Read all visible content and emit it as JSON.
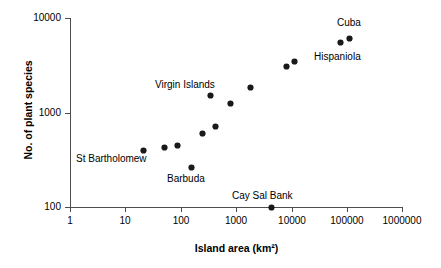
{
  "chart_data": {
    "type": "scatter",
    "title": "",
    "xlabel": "Island area (km²)",
    "ylabel": "No. of plant species",
    "xscale": "log",
    "yscale": "log",
    "xlim": [
      1,
      1000000
    ],
    "ylim": [
      100,
      10000
    ],
    "grid": false,
    "legend": "none",
    "xticks": [
      "1",
      "10",
      "100",
      "1000",
      "10000",
      "100000",
      "1000000"
    ],
    "yticks": [
      "100",
      "1000",
      "10000"
    ],
    "marker_color": "#1a1a1a",
    "axis_color": "#4d4d4d",
    "points": [
      {
        "label": "St Bartholomew",
        "x": 21,
        "y": 400
      },
      {
        "label": "",
        "x": 50,
        "y": 430
      },
      {
        "label": "",
        "x": 88,
        "y": 450
      },
      {
        "label": "Barbuda",
        "x": 155,
        "y": 265
      },
      {
        "label": "",
        "x": 250,
        "y": 600
      },
      {
        "label": "Virgin Islands",
        "x": 350,
        "y": 1500
      },
      {
        "label": "",
        "x": 430,
        "y": 720
      },
      {
        "label": "",
        "x": 780,
        "y": 1250
      },
      {
        "label": "",
        "x": 1800,
        "y": 1850
      },
      {
        "label": "Cay Sal Bank",
        "x": 4300,
        "y": 100
      },
      {
        "label": "",
        "x": 8300,
        "y": 3100
      },
      {
        "label": "",
        "x": 11500,
        "y": 3500
      },
      {
        "label": "Hispaniola",
        "x": 76000,
        "y": 5500
      },
      {
        "label": "Cuba",
        "x": 110000,
        "y": 6100
      }
    ],
    "annotations": [
      {
        "text": "St Bartholomew",
        "left": 76,
        "top": 153
      },
      {
        "text": "Barbuda",
        "top": 173,
        "left": 167
      },
      {
        "text": "Virgin Islands",
        "top": 79,
        "left": 155
      },
      {
        "text": "Cay Sal Bank",
        "top": 190,
        "left": 232
      },
      {
        "text": "Hispaniola",
        "top": 51,
        "left": 314
      },
      {
        "text": "Cuba",
        "top": 17,
        "left": 337
      }
    ]
  }
}
